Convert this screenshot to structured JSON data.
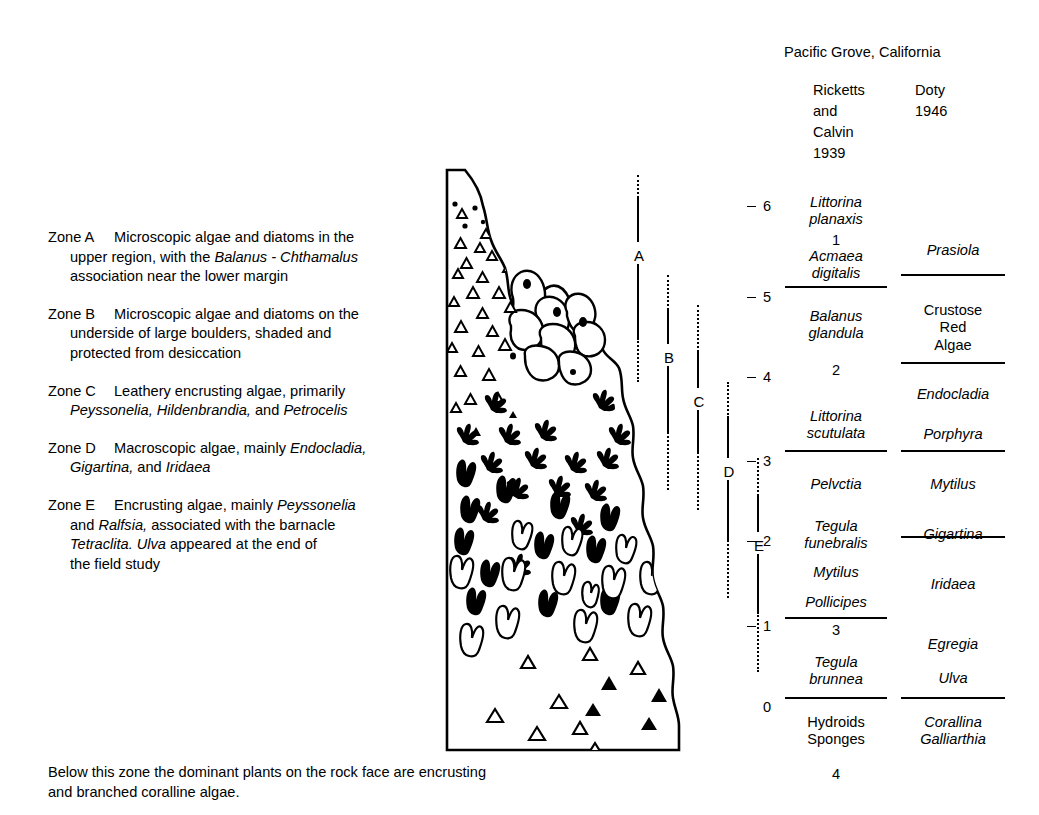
{
  "zones": {
    "entries": [
      {
        "label": "Zone A",
        "lines": [
          [
            {
              "t": "Microscopic algae and diatoms in the",
              "i": false
            }
          ],
          [
            {
              "t": "upper region, with the ",
              "i": false
            },
            {
              "t": "Balanus - Chthamalus",
              "i": true
            }
          ],
          [
            {
              "t": "association near the lower margin",
              "i": false
            }
          ]
        ]
      },
      {
        "label": "Zone B",
        "lines": [
          [
            {
              "t": "Microscopic algae and diatoms on the",
              "i": false
            }
          ],
          [
            {
              "t": "underside of large boulders, shaded and",
              "i": false
            }
          ],
          [
            {
              "t": "protected from desiccation",
              "i": false
            }
          ]
        ]
      },
      {
        "label": "Zone C",
        "lines": [
          [
            {
              "t": "Leathery encrusting algae, primarily",
              "i": false
            }
          ],
          [
            {
              "t": "Peyssonelia, Hildenbrandia,",
              "i": true
            },
            {
              "t": " and ",
              "i": false
            },
            {
              "t": "Petrocelis",
              "i": true
            }
          ]
        ]
      },
      {
        "label": "Zone D",
        "lines": [
          [
            {
              "t": "Macroscopic algae, mainly ",
              "i": false
            },
            {
              "t": "Endocladia,",
              "i": true
            }
          ],
          [
            {
              "t": "Gigartina,",
              "i": true
            },
            {
              "t": " and ",
              "i": false
            },
            {
              "t": "Iridaea",
              "i": true
            }
          ]
        ]
      },
      {
        "label": "Zone E",
        "lines": [
          [
            {
              "t": "Encrusting algae, mainly ",
              "i": false
            },
            {
              "t": "Peyssonelia",
              "i": true
            }
          ],
          [
            {
              "t": "and ",
              "i": false
            },
            {
              "t": "Ralfsia,",
              "i": true
            },
            {
              "t": " associated with the barnacle",
              "i": false
            }
          ],
          [
            {
              "t": "Tetraclita. Ulva",
              "i": true
            },
            {
              "t": " appeared at the end of",
              "i": false
            }
          ],
          [
            {
              "t": "the field study",
              "i": false
            }
          ]
        ]
      }
    ]
  },
  "caption": {
    "line1": "Below this zone the dominant plants on the rock face are encrusting",
    "line2": "and branched coralline algae."
  },
  "brackets": [
    {
      "letter": "A",
      "x": 22,
      "top_dot_start": 15,
      "top_dot_end": 38,
      "solid1_start": 38,
      "solid1_end": 82,
      "label_y": 88,
      "solid2_start": 104,
      "solid2_end": 178,
      "bot_dot_start": 178,
      "bot_dot_end": 222
    },
    {
      "letter": "B",
      "x": 52,
      "top_dot_start": 115,
      "top_dot_end": 150,
      "solid1_start": 150,
      "solid1_end": 184,
      "label_y": 190,
      "solid2_start": 206,
      "solid2_end": 272,
      "bot_dot_start": 272,
      "bot_dot_end": 330
    },
    {
      "letter": "C",
      "x": 82,
      "top_dot_start": 145,
      "top_dot_end": 192,
      "solid1_start": 192,
      "solid1_end": 228,
      "label_y": 234,
      "solid2_start": 250,
      "solid2_end": 292,
      "bot_dot_start": 292,
      "bot_dot_end": 350
    },
    {
      "letter": "D",
      "x": 112,
      "top_dot_start": 222,
      "top_dot_end": 258,
      "solid1_start": 258,
      "solid1_end": 298,
      "label_y": 304,
      "solid2_start": 320,
      "solid2_end": 380,
      "bot_dot_start": 380,
      "bot_dot_end": 438
    },
    {
      "letter": "E",
      "x": 142,
      "top_dot_start": 298,
      "top_dot_end": 336,
      "solid1_start": 336,
      "solid1_end": 372,
      "label_y": 378,
      "solid2_start": 394,
      "solid2_end": 452,
      "bot_dot_start": 452,
      "bot_dot_end": 512
    }
  ],
  "panel": {
    "location": "Pacific Grove, California",
    "column1_header": [
      "Ricketts",
      "and",
      "Calvin",
      "1939"
    ],
    "column2_header": [
      "Doty",
      "1946"
    ],
    "scale": {
      "values": [
        "6",
        "5",
        "4",
        "3",
        "2",
        "1",
        "0"
      ],
      "y": [
        163,
        254,
        334,
        418,
        498,
        583,
        664
      ]
    },
    "column1_entries": [
      {
        "text": "Littorina\nplanaxis",
        "y": 158,
        "italic": true
      },
      {
        "text": "1",
        "y": 196,
        "italic": false
      },
      {
        "text": "Acmaea\ndigitalis",
        "y": 212,
        "italic": true
      },
      {
        "text": "Balanus\nglandula",
        "y": 272,
        "italic": true
      },
      {
        "text": "2",
        "y": 326,
        "italic": false
      },
      {
        "text": "Littorina\nscutulata",
        "y": 372,
        "italic": true
      },
      {
        "text": "Pelvctia",
        "y": 440,
        "italic": true
      },
      {
        "text": "Tegula\nfunebralis",
        "y": 482,
        "italic": true
      },
      {
        "text": "Mytilus",
        "y": 528,
        "italic": true
      },
      {
        "text": "Pollicipes",
        "y": 558,
        "italic": true
      },
      {
        "text": "3",
        "y": 586,
        "italic": false
      },
      {
        "text": "Tegula\nbrunnea",
        "y": 618,
        "italic": true
      },
      {
        "text": "Hydroids\nSponges",
        "y": 678,
        "italic": false
      },
      {
        "text": "4",
        "y": 730,
        "italic": false
      }
    ],
    "column2_entries": [
      {
        "text": "Prasiola",
        "y": 206,
        "italic": true
      },
      {
        "text": "Crustose\nRed\nAlgae",
        "y": 266,
        "italic": false
      },
      {
        "text": "Endocladia",
        "y": 350,
        "italic": true
      },
      {
        "text": "Porphyra",
        "y": 390,
        "italic": true
      },
      {
        "text": "Mytilus",
        "y": 440,
        "italic": true
      },
      {
        "text": "Gigartina",
        "y": 490,
        "italic": true
      },
      {
        "text": "Iridaea",
        "y": 540,
        "italic": true
      },
      {
        "text": "Egregia",
        "y": 600,
        "italic": true
      },
      {
        "text": "Ulva",
        "y": 634,
        "italic": true
      },
      {
        "text": "Corallina\nGalliarthia",
        "y": 678,
        "italic": true
      }
    ],
    "column1_dividers": [
      250,
      414,
      581,
      661
    ],
    "column2_dividers": [
      238,
      326,
      414,
      500,
      661
    ]
  }
}
